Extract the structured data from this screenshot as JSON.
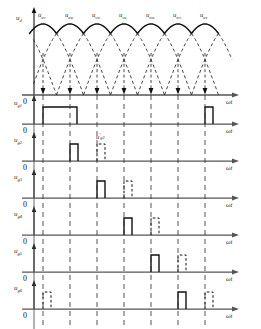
{
  "figure": {
    "type": "timing-diagram",
    "axis_label": "ωt",
    "zero_label": "0"
  },
  "top_plot": {
    "y_axis_label": "u",
    "y_axis_sub": "d",
    "segment_labels": [
      {
        "base": "u",
        "sub": "uv"
      },
      {
        "base": "u",
        "sub": "uw"
      },
      {
        "base": "u",
        "sub": "vw"
      },
      {
        "base": "u",
        "sub": "vu"
      },
      {
        "base": "u",
        "sub": "wu"
      },
      {
        "base": "u",
        "sub": "wv"
      },
      {
        "base": "u",
        "sub": "uv"
      }
    ],
    "commutation_points_x": [
      43,
      70,
      97,
      124,
      151,
      178,
      205
    ],
    "arc_count": 7
  },
  "chart_data": {
    "type": "line",
    "title": "",
    "xlabel": "ωt",
    "ylabel": "u_d",
    "grid": false,
    "legend": null,
    "commutation_interval_deg": 60,
    "pulse_rows": [
      {
        "name": "u_g1",
        "base": "u",
        "sub": "g1",
        "pulses": [
          {
            "start": 43,
            "width": 34,
            "style": "solid",
            "label": null
          },
          {
            "start": 205,
            "width": 8,
            "style": "solid",
            "label": null
          }
        ]
      },
      {
        "name": "u_g2",
        "base": "u",
        "sub": "g2",
        "pulses": [
          {
            "start": 70,
            "width": 8,
            "style": "solid",
            "label": null
          },
          {
            "start": 97,
            "width": 8,
            "style": "dashed",
            "label": "u'g2"
          }
        ]
      },
      {
        "name": "u_g3",
        "base": "u",
        "sub": "g3",
        "pulses": [
          {
            "start": 97,
            "width": 8,
            "style": "solid",
            "label": null
          },
          {
            "start": 124,
            "width": 8,
            "style": "dashed",
            "label": null
          }
        ]
      },
      {
        "name": "u_g4",
        "base": "u",
        "sub": "g4",
        "pulses": [
          {
            "start": 124,
            "width": 8,
            "style": "solid",
            "label": null
          },
          {
            "start": 151,
            "width": 8,
            "style": "dashed",
            "label": null
          }
        ]
      },
      {
        "name": "u_g5",
        "base": "u",
        "sub": "g5",
        "pulses": [
          {
            "start": 151,
            "width": 8,
            "style": "solid",
            "label": null
          },
          {
            "start": 178,
            "width": 8,
            "style": "dashed",
            "label": null
          }
        ]
      },
      {
        "name": "u_g6",
        "base": "u",
        "sub": "g6",
        "pulses": [
          {
            "start": 43,
            "width": 8,
            "style": "dashed",
            "label": null
          },
          {
            "start": 178,
            "width": 8,
            "style": "solid",
            "label": null
          },
          {
            "start": 205,
            "width": 8,
            "style": "dashed",
            "label": null
          }
        ]
      }
    ]
  },
  "secondary_pulse_label": {
    "base": "u",
    "prime": "′",
    "sub": "g2"
  }
}
